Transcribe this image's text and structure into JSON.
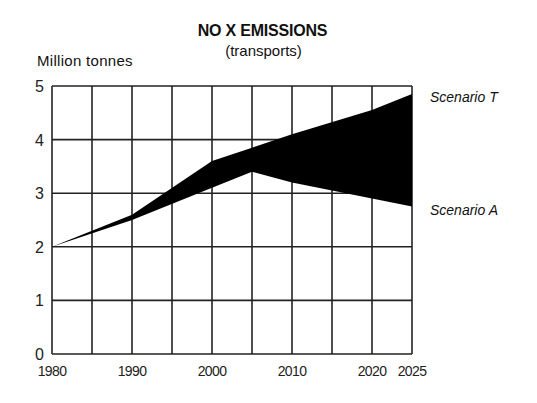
{
  "chart_data": {
    "type": "area",
    "title": "NO X EMISSIONS",
    "subtitle": "(transports)",
    "xlabel": "",
    "ylabel": "Million tonnes",
    "x": [
      1980,
      1990,
      2000,
      2005,
      2010,
      2020,
      2025
    ],
    "x_ticks": [
      "1980",
      "1990",
      "2000",
      "2010",
      "2020",
      "2025"
    ],
    "x_grid": [
      1980,
      1985,
      1990,
      1995,
      2000,
      2005,
      2010,
      2015,
      2020,
      2025
    ],
    "y_ticks": [
      "0",
      "1",
      "2",
      "3",
      "4",
      "5"
    ],
    "ylim": [
      0,
      5
    ],
    "xlim": [
      1980,
      2025
    ],
    "grid": true,
    "legend_position": "right (inline labels)",
    "series": [
      {
        "name": "Scenario T",
        "values": [
          2.0,
          2.6,
          3.6,
          3.85,
          4.1,
          4.55,
          4.85
        ]
      },
      {
        "name": "Scenario A",
        "values": [
          2.0,
          2.5,
          3.1,
          3.4,
          3.2,
          2.9,
          2.75
        ]
      }
    ],
    "fill_between": {
      "upper": "Scenario T",
      "lower": "Scenario A",
      "color": "#000000"
    }
  }
}
